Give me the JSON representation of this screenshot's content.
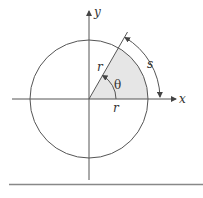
{
  "diagram": {
    "labels": {
      "x_axis": "x",
      "y_axis": "y",
      "radius_slanted": "r",
      "radius_horizontal": "r",
      "angle": "θ",
      "arc": "s"
    },
    "geometry": {
      "origin": [
        89,
        99
      ],
      "radius_px": 59,
      "angle_deg": 60
    },
    "colors": {
      "stroke": "#555555",
      "sector_fill": "#e6e6e6",
      "rule": "#888888",
      "text": "#333333"
    }
  }
}
